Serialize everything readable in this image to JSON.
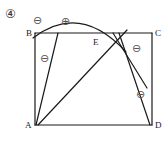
{
  "figure": {
    "item_number": "④",
    "vertex_labels": {
      "a": "A",
      "b": "B",
      "c": "C",
      "d": "D",
      "e": "E"
    },
    "region_signs": {
      "top_left": "⊖",
      "top_middle": "⊕",
      "left_inner": "⊖",
      "right_upper": "⊖",
      "right_lower": "⊖"
    },
    "colors": {
      "stroke": "#1a1a1a",
      "sign": "#555555",
      "background": "#ffffff"
    }
  }
}
